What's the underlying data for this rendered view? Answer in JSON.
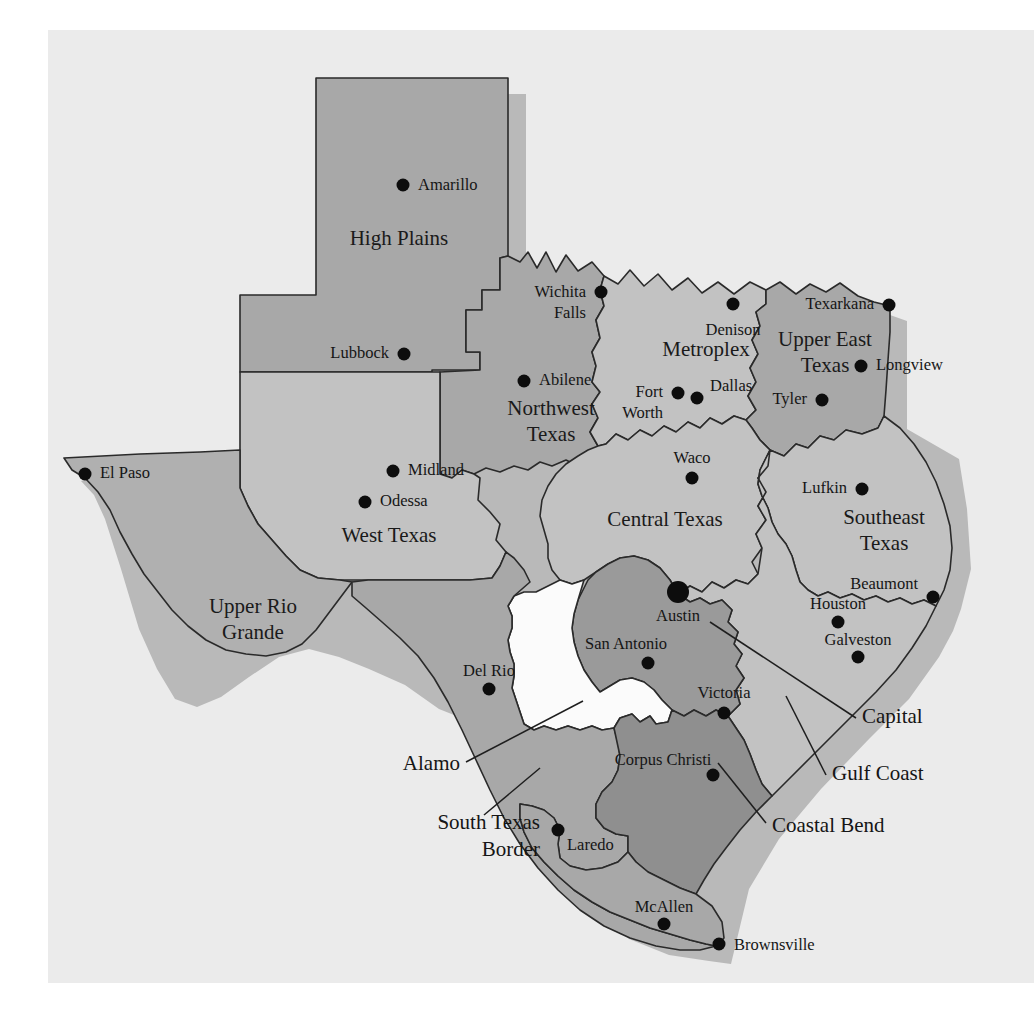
{
  "figure": {
    "background_color": "#ffffff",
    "paper_color": "#ebebeb",
    "outline_color": "#2a2a2a",
    "shadow_color": "#b9b9b9"
  },
  "regions": [
    {
      "id": "high-plains",
      "label": "High Plains",
      "label_lines": [
        "High Plains"
      ],
      "fill": "#a8a8a8",
      "label_x": 399,
      "label_y": 240
    },
    {
      "id": "northwest-texas",
      "label": "Northwest Texas",
      "label_lines": [
        "Northwest",
        "Texas"
      ],
      "fill": "#a8a8a8",
      "label_x": 551,
      "label_y": 410
    },
    {
      "id": "metroplex",
      "label": "Metroplex",
      "label_lines": [
        "Metroplex"
      ],
      "fill": "#c2c2c2",
      "label_x": 706,
      "label_y": 351
    },
    {
      "id": "upper-east-texas",
      "label": "Upper East Texas",
      "label_lines": [
        "Upper East",
        "Texas"
      ],
      "fill": "#a8a8a8",
      "label_x": 825,
      "label_y": 348
    },
    {
      "id": "west-texas",
      "label": "West Texas",
      "label_lines": [
        "West Texas"
      ],
      "fill": "#c2c2c2",
      "label_x": 389,
      "label_y": 537
    },
    {
      "id": "upper-rio-grande",
      "label": "Upper Rio Grande",
      "label_lines": [
        "Upper Rio",
        "Grande"
      ],
      "fill": "#b0b0b0",
      "label_x": 253,
      "label_y": 618
    },
    {
      "id": "central-texas",
      "label": "Central Texas",
      "label_lines": [
        "Central Texas"
      ],
      "fill": "#c2c2c2",
      "label_x": 665,
      "label_y": 521
    },
    {
      "id": "southeast-texas",
      "label": "Southeast Texas",
      "label_lines": [
        "Southeast",
        "Texas"
      ],
      "fill": "#c2c2c2",
      "label_x": 884,
      "label_y": 529
    },
    {
      "id": "capital",
      "label": "Capital",
      "label_lines": [],
      "fill": "#9a9a9a",
      "label_x": 0,
      "label_y": 0
    },
    {
      "id": "gulf-coast",
      "label": "Gulf Coast",
      "label_lines": [],
      "fill": "#c2c2c2",
      "label_x": 0,
      "label_y": 0
    },
    {
      "id": "alamo",
      "label": "Alamo",
      "label_lines": [],
      "fill": "#fbfbfb",
      "label_x": 0,
      "label_y": 0
    },
    {
      "id": "south-texas-border",
      "label": "South Texas Border",
      "label_lines": [],
      "fill": "#a8a8a8",
      "label_x": 0,
      "label_y": 0
    },
    {
      "id": "coastal-bend",
      "label": "Coastal Bend",
      "label_lines": [],
      "fill": "#8f8f8f",
      "label_x": 0,
      "label_y": 0
    }
  ],
  "cities": [
    {
      "name": "Amarillo",
      "dot_x": 403,
      "dot_y": 185,
      "label_x": 418,
      "label_y": 186,
      "anchor": "start",
      "capital": false
    },
    {
      "name": "Wichita Falls",
      "dot_x": 601,
      "dot_y": 292,
      "label_x": 586,
      "label_y": 293,
      "anchor": "end",
      "capital": false,
      "label_lines": [
        "Wichita",
        "Falls"
      ]
    },
    {
      "name": "Denison",
      "dot_x": 733,
      "dot_y": 304,
      "label_x": 733,
      "label_y": 330,
      "anchor": "mid",
      "capital": false
    },
    {
      "name": "Texarkana",
      "dot_x": 889,
      "dot_y": 305,
      "label_x": 874,
      "label_y": 305,
      "anchor": "end",
      "capital": false
    },
    {
      "name": "Longview",
      "dot_x": 861,
      "dot_y": 366,
      "label_x": 876,
      "label_y": 366,
      "anchor": "start",
      "capital": false
    },
    {
      "name": "Lubbock",
      "dot_x": 404,
      "dot_y": 354,
      "label_x": 389,
      "label_y": 354,
      "anchor": "end",
      "capital": false
    },
    {
      "name": "Abilene",
      "dot_x": 524,
      "dot_y": 381,
      "label_x": 539,
      "label_y": 381,
      "anchor": "start",
      "capital": false
    },
    {
      "name": "Fort Worth",
      "dot_x": 678,
      "dot_y": 393,
      "label_x": 663,
      "label_y": 394,
      "anchor": "end",
      "capital": false,
      "label_lines": [
        "Fort",
        "Worth"
      ]
    },
    {
      "name": "Dallas",
      "dot_x": 697,
      "dot_y": 398,
      "label_x": 712,
      "label_y": 387,
      "anchor": "start",
      "capital": false
    },
    {
      "name": "Tyler",
      "dot_x": 822,
      "dot_y": 400,
      "label_x": 807,
      "label_y": 400,
      "anchor": "end",
      "capital": false
    },
    {
      "name": "Midland",
      "dot_x": 393,
      "dot_y": 471,
      "label_x": 408,
      "label_y": 471,
      "anchor": "start",
      "capital": false
    },
    {
      "name": "Odessa",
      "dot_x": 365,
      "dot_y": 502,
      "label_x": 380,
      "label_y": 502,
      "anchor": "start",
      "capital": false
    },
    {
      "name": "Waco",
      "dot_x": 692,
      "dot_y": 478,
      "label_x": 692,
      "label_y": 459,
      "anchor": "mid",
      "capital": false
    },
    {
      "name": "Lufkin",
      "dot_x": 862,
      "dot_y": 489,
      "label_x": 847,
      "label_y": 489,
      "anchor": "end",
      "capital": false
    },
    {
      "name": "El Paso",
      "dot_x": 85,
      "dot_y": 474,
      "label_x": 100,
      "label_y": 474,
      "anchor": "start",
      "capital": false
    },
    {
      "name": "Austin",
      "dot_x": 678,
      "dot_y": 592,
      "label_x": 678,
      "label_y": 616,
      "anchor": "mid",
      "capital": true
    },
    {
      "name": "Beaumont",
      "dot_x": 933,
      "dot_y": 597,
      "label_x": 918,
      "label_y": 586,
      "anchor": "end",
      "capital": false
    },
    {
      "name": "Houston",
      "dot_x": 838,
      "dot_y": 622,
      "label_x": 838,
      "label_y": 606,
      "anchor": "mid",
      "capital": false
    },
    {
      "name": "Galveston",
      "dot_x": 858,
      "dot_y": 657,
      "label_x": 858,
      "label_y": 642,
      "anchor": "mid",
      "capital": false
    },
    {
      "name": "San Antonio",
      "dot_x": 648,
      "dot_y": 663,
      "label_x": 648,
      "label_y": 645,
      "anchor": "mid",
      "capital": false
    },
    {
      "name": "Del Rio",
      "dot_x": 489,
      "dot_y": 689,
      "label_x": 489,
      "label_y": 672,
      "anchor": "mid",
      "capital": false
    },
    {
      "name": "Victoria",
      "dot_x": 724,
      "dot_y": 713,
      "label_x": 724,
      "label_y": 694,
      "anchor": "mid",
      "capital": false
    },
    {
      "name": "Corpus Christi",
      "dot_x": 713,
      "dot_y": 775,
      "label_x": 663,
      "label_y": 761,
      "anchor": "mid",
      "capital": false
    },
    {
      "name": "Laredo",
      "dot_x": 558,
      "dot_y": 830,
      "label_x": 573,
      "label_y": 845,
      "anchor": "start",
      "capital": false
    },
    {
      "name": "McAllen",
      "dot_x": 664,
      "dot_y": 924,
      "label_x": 664,
      "label_y": 908,
      "anchor": "mid",
      "capital": false
    },
    {
      "name": "Brownsville",
      "dot_x": 719,
      "dot_y": 944,
      "label_x": 734,
      "label_y": 946,
      "anchor": "start",
      "capital": false
    }
  ],
  "callouts": [
    {
      "name": "Capital",
      "label": "Capital",
      "label_x": 862,
      "label_y": 718,
      "anchor": "start",
      "line": "M 856 718 L 710 622"
    },
    {
      "name": "Gulf Coast",
      "label": "Gulf Coast",
      "label_x": 832,
      "label_y": 775,
      "anchor": "start",
      "line": "M 826 775 L 786 696"
    },
    {
      "name": "Coastal Bend",
      "label": "Coastal Bend",
      "label_x": 772,
      "label_y": 827,
      "anchor": "start",
      "line": "M 766 823 L 718 763"
    },
    {
      "name": "Alamo",
      "label": "Alamo",
      "label_x": 460,
      "label_y": 765,
      "anchor": "end",
      "line": "M 466 762 L 583 701"
    },
    {
      "name": "South Texas Border",
      "label": "South Texas Border",
      "label_lines": [
        "South Texas",
        "Border"
      ],
      "label_x": 478,
      "label_y": 833,
      "anchor": "end",
      "line": "M 484 815 L 540 768"
    }
  ]
}
